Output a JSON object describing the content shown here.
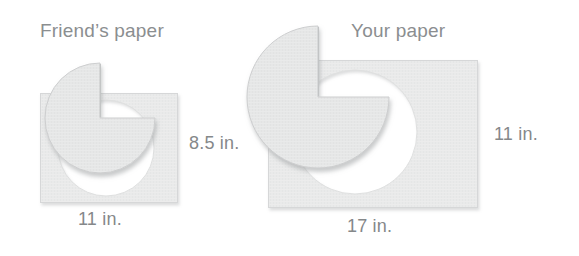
{
  "figure": {
    "background_color": "#ffffff",
    "paper_fill": "#e9eaea",
    "paper_edge": "#d8d9d9",
    "disc_fill": "#e5e6e6",
    "disc_edge": "#c9cacb",
    "hole_fill": "#ffffff",
    "shadow_color": "#b9bbbc",
    "text_color": "#8b8e90"
  },
  "left_figure": {
    "title": "Friend’s paper",
    "width_label": "11 in.",
    "height_label": "8.5 in."
  },
  "right_figure": {
    "title": "Your paper",
    "width_label": "17 in.",
    "height_label": "11 in."
  }
}
